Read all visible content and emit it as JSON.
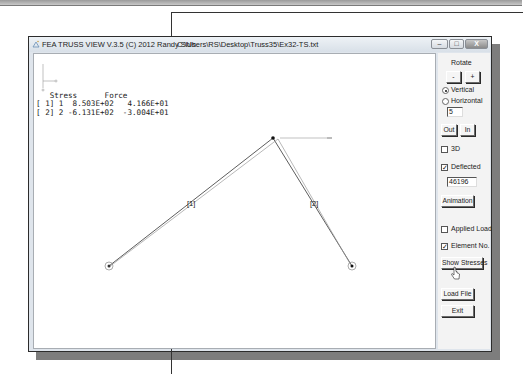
{
  "window": {
    "title": "FEA TRUSS VIEW V.3.5 (C) 2012 Randy Shih",
    "file_path": "C:\\Users\\RS\\Desktop\\Truss35\\Ex32-TS.txt",
    "controls": {
      "minimize": "–",
      "maximize": "□",
      "close": "X"
    }
  },
  "canvas": {
    "results_header": "   Stress      Force",
    "results_rows": [
      "[ 1] 1  8.503E+02   4.166E+01",
      "[ 2] 2 -6.131E+02  -3.004E+01"
    ],
    "elements": [
      {
        "label": "[1]"
      },
      {
        "label": "[2]"
      }
    ]
  },
  "side_panel": {
    "rotate_label": "Rotate",
    "rotate_minus": "-",
    "rotate_plus": "+",
    "radio_vertical": "Vertical",
    "radio_horizontal": "Horizontal",
    "rotate_step_value": "5",
    "zoom_out": "Out",
    "zoom_in": "In",
    "check_3d": "3D",
    "check_deflected": "Deflected",
    "deflection_scale_value": "46196",
    "animation_button": "Animation",
    "check_applied_load": "Applied Load",
    "check_element_no": "Element No.",
    "show_stresses_button": "Show Stresses",
    "load_file_button": "Load File",
    "exit_button": "Exit",
    "state": {
      "vertical_selected": true,
      "3d_checked": false,
      "deflected_checked": true,
      "applied_load_checked": false,
      "element_no_checked": true
    },
    "check_mark": "✓"
  }
}
